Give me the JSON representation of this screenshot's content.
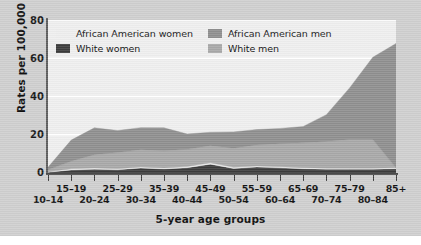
{
  "chart_data": {
    "type": "area",
    "stacked": true,
    "title": "",
    "xlabel": "5-year age groups",
    "ylabel": "Rates per 100,000",
    "ylim": [
      0,
      80
    ],
    "yticks": [
      0,
      20,
      40,
      60,
      80
    ],
    "grid": "horizontal",
    "legend_position": "top-inside",
    "categories": [
      "10–14",
      "15–19",
      "20–24",
      "25–29",
      "30–34",
      "35–39",
      "40–44",
      "45–49",
      "50–54",
      "55–59",
      "60–64",
      "65–69",
      "70–74",
      "75–79",
      "80–84",
      "85+"
    ],
    "series": [
      {
        "name": "White women",
        "color": "#3c3c3c",
        "values": [
          0.4,
          1.6,
          2.0,
          1.7,
          2.6,
          2.1,
          2.8,
          4.6,
          2.4,
          3.1,
          2.7,
          2.2,
          2.0,
          2.0,
          2.0,
          2.2
        ]
      },
      {
        "name": "African American women",
        "color": "#eeeeee",
        "values": [
          0.3,
          0.6,
          0.6,
          0.5,
          0.6,
          0.5,
          0.6,
          0.7,
          0.6,
          0.6,
          0.6,
          0.6,
          0.5,
          0.5,
          0.5,
          0.5
        ]
      },
      {
        "name": "White men",
        "color": "#a8a8a8",
        "values": [
          1.0,
          4.0,
          7.0,
          8.5,
          9.0,
          9.0,
          9.0,
          9.0,
          10.0,
          11.0,
          12.0,
          13.0,
          14.0,
          15.0,
          15.0,
          0.0
        ]
      },
      {
        "name": "African American men",
        "color": "#8f8f8f",
        "values": [
          1.3,
          11.0,
          14.0,
          11.5,
          11.5,
          12.0,
          8.0,
          7.0,
          8.5,
          8.0,
          8.0,
          8.5,
          14.0,
          27.0,
          43.0,
          65.0
        ]
      }
    ],
    "stack_totals": [
      3.0,
      17.2,
      23.6,
      22.2,
      23.7,
      23.6,
      20.4,
      21.3,
      21.5,
      22.7,
      23.3,
      24.3,
      30.5,
      44.5,
      60.5,
      70.0
    ]
  },
  "axis": {
    "y_title": "Rates per 100,000",
    "x_title": "5-year age groups",
    "y_tick_labels": [
      "80",
      "60",
      "40",
      "20",
      "0"
    ],
    "x_tick_labels_top": [
      "15–19",
      "25–29",
      "35–39",
      "45–49",
      "55–59",
      "65–69",
      "75–79",
      "85+"
    ],
    "x_tick_labels_bottom": [
      "10–14",
      "20–24",
      "30–34",
      "40–44",
      "50–54",
      "60–64",
      "70–74",
      "80–84"
    ]
  },
  "legend": {
    "left_column": [
      {
        "label": "African American women",
        "color": "#eeeeee"
      },
      {
        "label": "White women",
        "color": "#3c3c3c"
      }
    ],
    "right_column": [
      {
        "label": "African American men",
        "color": "#8f8f8f"
      },
      {
        "label": "White men",
        "color": "#a8a8a8"
      }
    ]
  },
  "colors": {
    "figure_background": "#cfcfcf",
    "plot_background": "#efefef",
    "gridline": "#ffffff",
    "axis": "#4a4a4a",
    "text": "#141414"
  }
}
